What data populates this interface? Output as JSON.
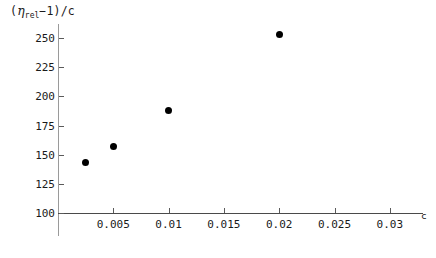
{
  "chart_data": {
    "type": "scatter",
    "title": "",
    "ylabel": "(ηrel-1)/c",
    "ylabel_parts": {
      "open": "(",
      "eta": "η",
      "subscript": "rel",
      "minus_one": "−1",
      "close": ")",
      "divider": "/c"
    },
    "xlabel": "c",
    "x": [
      0.0025,
      0.005,
      0.01,
      0.02
    ],
    "y": [
      143,
      157,
      188,
      253
    ],
    "points": [
      {
        "x": 0.0025,
        "y": 143
      },
      {
        "x": 0.005,
        "y": 157
      },
      {
        "x": 0.01,
        "y": 188
      },
      {
        "x": 0.02,
        "y": 253
      }
    ],
    "xlim": [
      0,
      0.033
    ],
    "ylim": [
      93,
      262
    ],
    "xticks": [
      0.005,
      0.01,
      0.015,
      0.02,
      0.025,
      0.03
    ],
    "xtick_labels": [
      "0.005",
      "0.01",
      "0.015",
      "0.02",
      "0.025",
      "0.03"
    ],
    "yticks": [
      100,
      125,
      150,
      175,
      200,
      225,
      250
    ],
    "ytick_labels": [
      "100",
      "125",
      "150",
      "175",
      "200",
      "225",
      "250"
    ],
    "grid": false,
    "legend": null,
    "marker": "filled-circle",
    "marker_color": "#000000",
    "axis_color": "#4a4a4a"
  }
}
